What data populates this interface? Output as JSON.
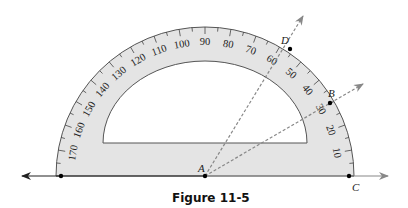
{
  "figure": {
    "caption": "Figure 11-5",
    "colors": {
      "protractor_fill": "#e4e4e4",
      "protractor_stroke": "#444444",
      "ray_color": "#888888",
      "line_color": "#222222",
      "point_color": "#000000"
    },
    "protractor": {
      "center": [
        205,
        176
      ],
      "outer_radius": 149,
      "inner_radius": 82,
      "inner_base_y": 143,
      "scale_labels": [
        "10",
        "20",
        "30",
        "40",
        "50",
        "60",
        "70",
        "80",
        "90",
        "100",
        "110",
        "120",
        "130",
        "140",
        "150",
        "160",
        "170"
      ]
    },
    "points": {
      "A": {
        "label": "A",
        "coords": [
          205,
          176
        ]
      },
      "B": {
        "label": "B",
        "coords": [
          330,
          103
        ]
      },
      "C": {
        "label": "C",
        "coords": [
          349,
          176
        ]
      },
      "D": {
        "label": "D",
        "coords": [
          290,
          49
        ]
      }
    },
    "rays": [
      {
        "name": "ray-AB",
        "from": "A",
        "through": "B",
        "style": "dashed"
      },
      {
        "name": "ray-AD",
        "from": "A",
        "through": "D",
        "style": "dashed"
      }
    ],
    "line": {
      "name": "line-through-A-C",
      "arrows": "both"
    }
  }
}
